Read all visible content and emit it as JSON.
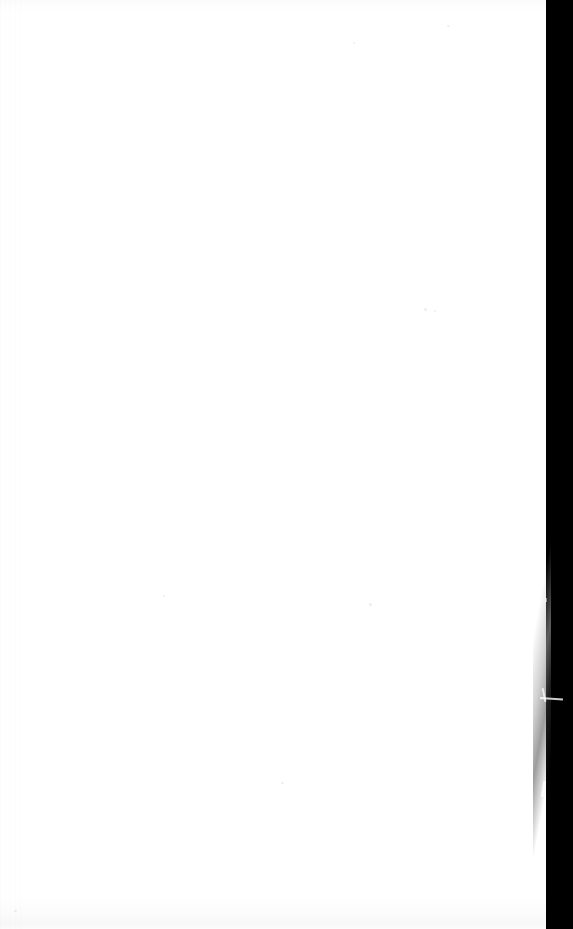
{
  "document": {
    "kind": "scanned-page",
    "title": "Blank scanned page",
    "page_state": "blank",
    "visible_text": "",
    "orientation": "portrait",
    "canvas": {
      "width_px": 573,
      "height_px": 929
    }
  },
  "page": {
    "label": "blank page",
    "background_color": "#ffffff",
    "left_px": 0,
    "top_px": 0,
    "width_px": 546,
    "height_px": 929
  },
  "scanner_background": {
    "label": "scanner background",
    "color": "#000000",
    "side": "right",
    "left_px": 533,
    "width_px": 40,
    "height_px": 929
  },
  "paper_edge": {
    "label": "paper edge",
    "description": "Slightly slanted cut edge of the sheet against the black scanner background.",
    "top_x_px": 545,
    "bottom_x_px": 539
  },
  "artifacts": [
    {
      "name": "edge-speck",
      "approx_x_px": 541,
      "approx_y_px": 495,
      "color": "#ffffff"
    },
    {
      "name": "edge-streak",
      "approx_x_px": 548,
      "approx_y_px": 700,
      "color": "#ffffff"
    },
    {
      "name": "edge-streak",
      "approx_x_px": 543,
      "approx_y_px": 789,
      "color": "#ffffff"
    },
    {
      "name": "edge-nick",
      "approx_x_px": 545,
      "approx_y_px": 600,
      "color": "#ffffff"
    },
    {
      "name": "edge-nick",
      "approx_x_px": 544,
      "approx_y_px": 154,
      "color": "#ffffff"
    },
    {
      "name": "edge-nick",
      "approx_x_px": 540,
      "approx_y_px": 866,
      "color": "#ffffff"
    }
  ],
  "noise": {
    "label": "scanner noise",
    "left_streaks": "faint vertical banding along the left margin",
    "bottom_shading": "faint gray shading along the bottom margin",
    "dust_specks": 8,
    "color": "#f2f2f2"
  }
}
